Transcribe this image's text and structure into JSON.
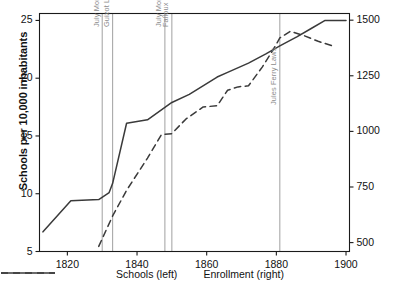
{
  "chart_data": {
    "type": "line",
    "title": "",
    "xlabel": "",
    "ylabel": "Schools per 10,000 inhabitants",
    "ylabel_right": "Enrollment per 10,000 inhabitants",
    "xlim": [
      1812,
      1901
    ],
    "ylim": [
      5,
      25.6
    ],
    "ylim_right": [
      460,
      1530
    ],
    "grid": false,
    "legend_position": "bottom-center",
    "xticks": [
      1820,
      1840,
      1860,
      1880,
      1900
    ],
    "xtick_labels": [
      "1820",
      "1840",
      "1860",
      "1880",
      "1900"
    ],
    "yticks_left": [
      5,
      10,
      15,
      20,
      25
    ],
    "ytick_labels_left": [
      "5",
      "10",
      "15",
      "20",
      "25"
    ],
    "yticks_right": [
      500,
      750,
      1000,
      1250,
      1500
    ],
    "ytick_labels_right": [
      "500",
      "750",
      "1000",
      "1250",
      "1500"
    ],
    "series": [
      {
        "name": "Schools (left)",
        "label": "Schools (left)",
        "axis": "left",
        "style": "solid",
        "color": "#3a3a3a",
        "x": [
          1813,
          1821,
          1829,
          1832,
          1833,
          1837,
          1843,
          1850,
          1855,
          1863,
          1866,
          1872,
          1877,
          1881,
          1886,
          1890,
          1894,
          1900
        ],
        "y": [
          6.7,
          9.4,
          9.5,
          10.1,
          10.9,
          16.1,
          16.4,
          17.9,
          18.6,
          20.1,
          20.5,
          21.3,
          22.1,
          22.8,
          23.6,
          24.3,
          25.0,
          25.0
        ]
      },
      {
        "name": "Enrollment (right)",
        "label": "Enrollment (right)",
        "axis": "right",
        "style": "dashed",
        "color": "#3a3a3a",
        "x": [
          1829,
          1833,
          1837,
          1843,
          1847,
          1850,
          1854,
          1859,
          1863,
          1866,
          1869,
          1872,
          1876,
          1879,
          1881,
          1884,
          1888,
          1892,
          1897
        ],
        "y": [
          483,
          620,
          735,
          880,
          985,
          990,
          1055,
          1110,
          1115,
          1185,
          1200,
          1205,
          1290,
          1365,
          1420,
          1450,
          1430,
          1405,
          1380
        ]
      }
    ],
    "annotations": [
      {
        "label": "July Monarchy begins",
        "x": 1830
      },
      {
        "label": "Guizot Law",
        "x": 1833
      },
      {
        "label": "July Monarchy ends",
        "x": 1848
      },
      {
        "label": "Falloux Law",
        "x": 1850
      },
      {
        "label": "Jules Ferry Laws",
        "x": 1881
      }
    ],
    "annotation_color": "#a0a0a0"
  }
}
